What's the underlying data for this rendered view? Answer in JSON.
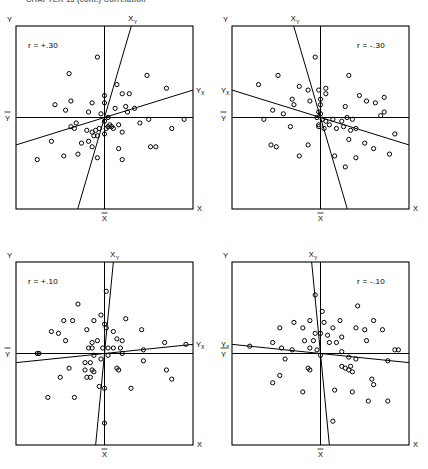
{
  "header": {
    "text": "CHAPTER 13   (cont.)  Correlation",
    "visible_fragment": true
  },
  "figure": {
    "type": "scatter-matrix",
    "panel_count": 4,
    "axis_labels": {
      "y_axis": "Y",
      "x_axis": "X",
      "y_mean": "Y",
      "x_mean": "X",
      "regression_x_on_y": "X",
      "regression_x_on_y_sub": "Y",
      "regression_y_on_x": "Y",
      "regression_y_on_x_sub": "X"
    }
  },
  "chart_data": {
    "type": "scatter",
    "xlabel": "X",
    "ylabel": "Y",
    "xlim": [
      0,
      100
    ],
    "ylim": [
      0,
      100
    ],
    "grid": false,
    "legend": "none",
    "annotations": [
      "X and Y mean reference lines cross at the centroid",
      "Two regression lines shown per panel: Y-on-X and X-on-Y"
    ],
    "panels": [
      {
        "id": "panel-top-left",
        "r_label": "r = +.30",
        "r_value": 0.3,
        "position": "top-left",
        "mean_x": 50,
        "mean_y": 50,
        "reg_y_on_x": {
          "slope": 0.3,
          "label": "Y",
          "sub": "X"
        },
        "reg_x_on_y": {
          "slope": 3.3,
          "label": "X",
          "sub": "Y"
        },
        "points": [
          [
            46,
            83
          ],
          [
            30,
            74
          ],
          [
            57,
            68
          ],
          [
            74,
            73
          ],
          [
            60,
            63
          ],
          [
            64,
            63
          ],
          [
            85,
            66
          ],
          [
            22,
            57
          ],
          [
            31,
            59
          ],
          [
            43,
            58
          ],
          [
            50,
            62
          ],
          [
            50,
            58
          ],
          [
            28,
            54
          ],
          [
            41,
            53
          ],
          [
            48,
            52
          ],
          [
            56,
            55
          ],
          [
            62,
            56
          ],
          [
            63,
            53
          ],
          [
            67,
            55
          ],
          [
            34,
            47
          ],
          [
            50,
            48
          ],
          [
            52,
            50
          ],
          [
            75,
            49
          ],
          [
            95,
            49
          ],
          [
            31,
            45
          ],
          [
            33,
            44
          ],
          [
            40,
            43
          ],
          [
            43,
            42
          ],
          [
            45,
            43
          ],
          [
            47,
            44
          ],
          [
            51,
            44
          ],
          [
            52,
            45
          ],
          [
            54,
            45
          ],
          [
            55,
            44
          ],
          [
            53,
            46
          ],
          [
            58,
            46
          ],
          [
            44,
            40
          ],
          [
            46,
            40
          ],
          [
            50,
            41
          ],
          [
            60,
            42
          ],
          [
            70,
            47
          ],
          [
            88,
            44
          ],
          [
            20,
            37
          ],
          [
            37,
            36
          ],
          [
            41,
            37
          ],
          [
            43,
            34
          ],
          [
            58,
            33
          ],
          [
            76,
            34
          ],
          [
            79,
            34
          ],
          [
            27,
            29
          ],
          [
            12,
            27
          ],
          [
            35,
            30
          ],
          [
            46,
            28
          ],
          [
            60,
            27
          ]
        ]
      },
      {
        "id": "panel-top-right",
        "r_label": "r = -.30",
        "r_value": -0.3,
        "position": "top-right",
        "mean_x": 50,
        "mean_y": 50,
        "reg_y_on_x": {
          "slope": -0.3,
          "label": "Y",
          "sub": "X"
        },
        "reg_x_on_y": {
          "slope": -3.3,
          "label": "X",
          "sub": "Y"
        },
        "points": [
          [
            47,
            83
          ],
          [
            26,
            73
          ],
          [
            66,
            73
          ],
          [
            15,
            68
          ],
          [
            38,
            67
          ],
          [
            43,
            65
          ],
          [
            49,
            65
          ],
          [
            53,
            63
          ],
          [
            53,
            66
          ],
          [
            72,
            62
          ],
          [
            86,
            61
          ],
          [
            34,
            60
          ],
          [
            35,
            57
          ],
          [
            44,
            59
          ],
          [
            50,
            60
          ],
          [
            50,
            57
          ],
          [
            76,
            59
          ],
          [
            81,
            58
          ],
          [
            64,
            56
          ],
          [
            23,
            54
          ],
          [
            29,
            52
          ],
          [
            49,
            53
          ],
          [
            50,
            52
          ],
          [
            86,
            53
          ],
          [
            18,
            49
          ],
          [
            48,
            50
          ],
          [
            51,
            49
          ],
          [
            53,
            48
          ],
          [
            57,
            49
          ],
          [
            62,
            48
          ],
          [
            65,
            50
          ],
          [
            68,
            49
          ],
          [
            84,
            51
          ],
          [
            33,
            45
          ],
          [
            49,
            45
          ],
          [
            52,
            44
          ],
          [
            59,
            44
          ],
          [
            63,
            45
          ],
          [
            67,
            43
          ],
          [
            70,
            44
          ],
          [
            92,
            41
          ],
          [
            66,
            38
          ],
          [
            22,
            35
          ],
          [
            25,
            34
          ],
          [
            43,
            35
          ],
          [
            75,
            36
          ],
          [
            80,
            33
          ],
          [
            38,
            29
          ],
          [
            58,
            29
          ],
          [
            70,
            28
          ],
          [
            89,
            30
          ],
          [
            64,
            23
          ],
          [
            49,
            46
          ],
          [
            55,
            46
          ]
        ]
      },
      {
        "id": "panel-bottom-left",
        "r_label": "r = +.10",
        "r_value": 0.1,
        "position": "bottom-left",
        "mean_x": 50,
        "mean_y": 50,
        "reg_y_on_x": {
          "slope": 0.1,
          "label": "Y",
          "sub": "X"
        },
        "reg_x_on_y": {
          "slope": 10.0,
          "label": "X",
          "sub": "Y"
        },
        "points": [
          [
            51,
            84
          ],
          [
            35,
            77
          ],
          [
            48,
            71
          ],
          [
            27,
            68
          ],
          [
            32,
            68
          ],
          [
            44,
            68
          ],
          [
            62,
            69
          ],
          [
            50,
            66
          ],
          [
            51,
            64
          ],
          [
            40,
            63
          ],
          [
            20,
            62
          ],
          [
            24,
            61
          ],
          [
            55,
            62
          ],
          [
            71,
            63
          ],
          [
            28,
            57
          ],
          [
            43,
            56
          ],
          [
            46,
            57
          ],
          [
            57,
            58
          ],
          [
            60,
            57
          ],
          [
            84,
            56
          ],
          [
            96,
            55
          ],
          [
            41,
            53
          ],
          [
            43,
            53
          ],
          [
            49,
            53
          ],
          [
            52,
            53
          ],
          [
            55,
            53
          ],
          [
            59,
            53
          ],
          [
            72,
            52
          ],
          [
            12,
            50
          ],
          [
            13,
            50
          ],
          [
            39,
            45
          ],
          [
            42,
            45
          ],
          [
            72,
            46
          ],
          [
            30,
            42
          ],
          [
            39,
            41
          ],
          [
            43,
            41
          ],
          [
            44,
            40
          ],
          [
            57,
            42
          ],
          [
            58,
            41
          ],
          [
            85,
            41
          ],
          [
            25,
            37
          ],
          [
            40,
            37
          ],
          [
            42,
            37
          ],
          [
            88,
            36
          ],
          [
            47,
            32
          ],
          [
            50,
            31
          ],
          [
            65,
            31
          ],
          [
            18,
            26
          ],
          [
            33,
            26
          ],
          [
            50,
            12
          ],
          [
            52,
            49
          ],
          [
            48,
            47
          ],
          [
            44,
            49
          ],
          [
            60,
            50
          ]
        ]
      },
      {
        "id": "panel-bottom-right",
        "r_label": "r = -.10",
        "r_value": -0.1,
        "position": "bottom-right",
        "mean_x": 50,
        "mean_y": 50,
        "reg_y_on_x": {
          "slope": -0.1,
          "label": "Y",
          "sub": "X"
        },
        "reg_x_on_y": {
          "slope": -10.0,
          "label": "X",
          "sub": "Y"
        },
        "points": [
          [
            47,
            82
          ],
          [
            71,
            76
          ],
          [
            51,
            73
          ],
          [
            35,
            67
          ],
          [
            44,
            68
          ],
          [
            52,
            67
          ],
          [
            61,
            68
          ],
          [
            80,
            68
          ],
          [
            27,
            64
          ],
          [
            40,
            64
          ],
          [
            57,
            64
          ],
          [
            70,
            64
          ],
          [
            75,
            63
          ],
          [
            85,
            63
          ],
          [
            47,
            61
          ],
          [
            50,
            61
          ],
          [
            54,
            60
          ],
          [
            62,
            59
          ],
          [
            23,
            56
          ],
          [
            41,
            57
          ],
          [
            46,
            57
          ],
          [
            55,
            56
          ],
          [
            59,
            56
          ],
          [
            76,
            57
          ],
          [
            10,
            54
          ],
          [
            28,
            53
          ],
          [
            34,
            52
          ],
          [
            44,
            53
          ],
          [
            48,
            52
          ],
          [
            62,
            51
          ],
          [
            92,
            52
          ],
          [
            94,
            52
          ],
          [
            30,
            47
          ],
          [
            66,
            48
          ],
          [
            70,
            47
          ],
          [
            88,
            46
          ],
          [
            43,
            42
          ],
          [
            44,
            41
          ],
          [
            62,
            43
          ],
          [
            64,
            42
          ],
          [
            66,
            41
          ],
          [
            67,
            43
          ],
          [
            68,
            40
          ],
          [
            27,
            38
          ],
          [
            23,
            34
          ],
          [
            79,
            36
          ],
          [
            80,
            33
          ],
          [
            40,
            29
          ],
          [
            58,
            30
          ],
          [
            68,
            29
          ],
          [
            77,
            24
          ],
          [
            88,
            24
          ],
          [
            57,
            13
          ],
          [
            50,
            49
          ]
        ]
      }
    ]
  }
}
